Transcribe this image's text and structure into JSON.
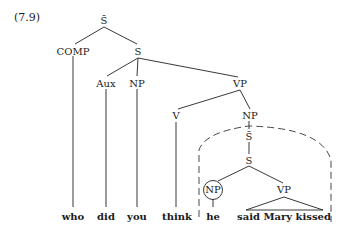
{
  "example_number": "(7.9)",
  "tree": {
    "root": "S̄",
    "comp": "COMP",
    "s": "S",
    "aux": "Aux",
    "np_subject": "NP",
    "vp": "VP",
    "v": "V",
    "np_object": "NP",
    "embedded_sbar": "S̄",
    "embedded_s": "S",
    "embedded_np": "NP",
    "embedded_vp": "VP"
  },
  "words": {
    "who": "who",
    "did": "did",
    "you": "you",
    "think": "think",
    "he": "he",
    "vp_phrase": "said Mary kissed"
  },
  "annotations": {
    "circled_node": "embedded_np",
    "dashed_region": "embedded clause boundary (island)",
    "triangle_node": "embedded_vp"
  }
}
